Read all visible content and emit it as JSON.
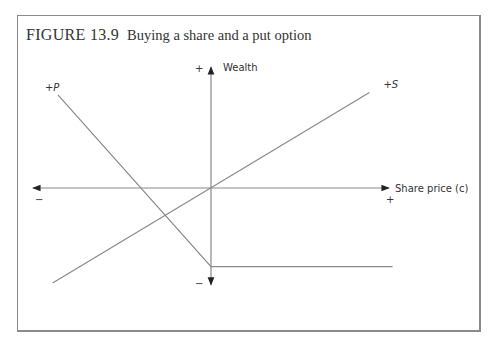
{
  "figure": {
    "number": "FIGURE 13.9",
    "caption": "Buying a share and a put option"
  },
  "chart_data": {
    "type": "line",
    "title": "Buying a share and a put option",
    "xlabel": "Share price (c)",
    "ylabel": "Wealth",
    "xlim": [
      -10,
      10
    ],
    "ylim": [
      -8,
      10
    ],
    "axis_signs": {
      "x_negative": "−",
      "x_positive": "+",
      "y_positive": "+",
      "y_negative": "−"
    },
    "grid": false,
    "legend": "none (series labelled directly)",
    "series": [
      {
        "name": "+S",
        "label_parts": [
          "+",
          "S"
        ],
        "points": [
          [
            -8.9,
            -7.85
          ],
          [
            8.9,
            7.9
          ]
        ],
        "color": "#8a8a8a"
      },
      {
        "name": "+P",
        "label_parts": [
          "+",
          "P"
        ],
        "points": [
          [
            -8.6,
            7.7
          ],
          [
            0,
            -6.5
          ],
          [
            10.2,
            -6.5
          ]
        ],
        "color": "#8a8a8a"
      }
    ]
  }
}
